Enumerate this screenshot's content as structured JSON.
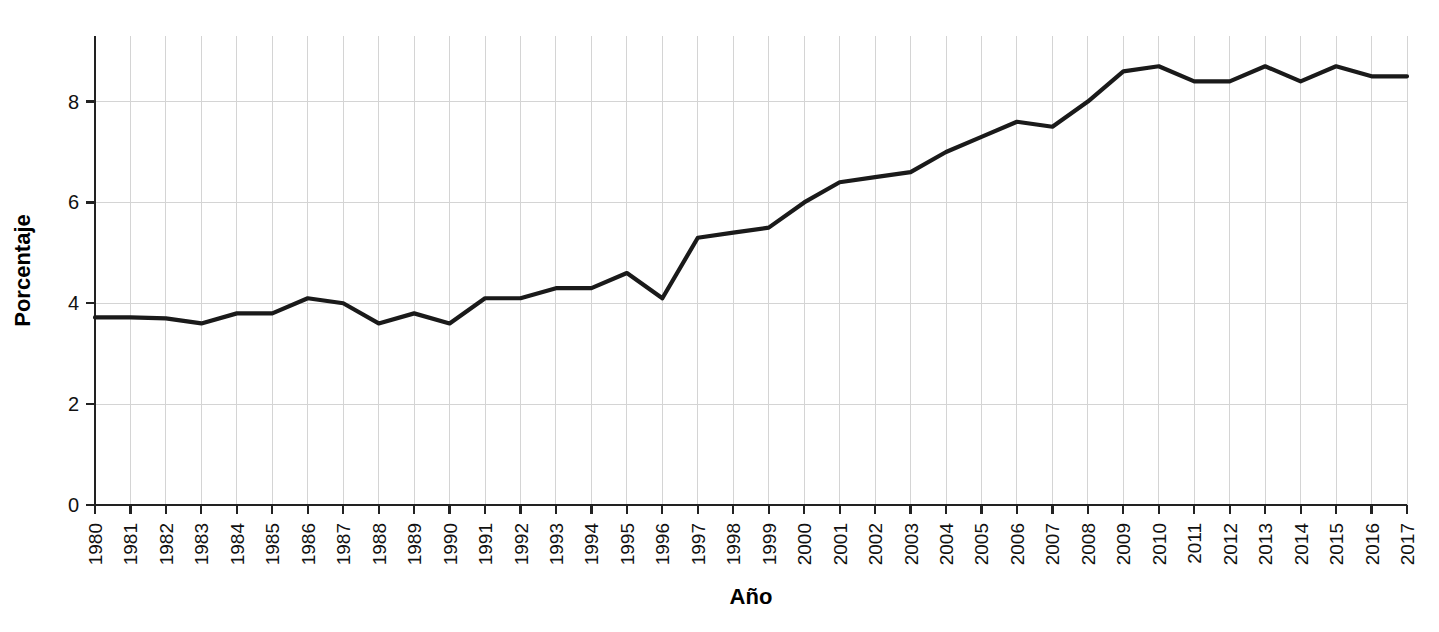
{
  "chart_data": {
    "type": "line",
    "title": "",
    "xlabel": "Año",
    "ylabel": "Porcentaje",
    "xlim": [
      1980,
      2017
    ],
    "ylim": [
      0,
      9.3
    ],
    "yticks": [
      0,
      2,
      4,
      6,
      8
    ],
    "ytick_labels": [
      "0",
      "2",
      "4",
      "6",
      "8"
    ],
    "grid": true,
    "legend": "none",
    "line_color": "#1a1a1a",
    "grid_color": "#d4d4d4",
    "axis_color": "#222222",
    "categories": [
      "1980",
      "1981",
      "1982",
      "1983",
      "1984",
      "1985",
      "1986",
      "1987",
      "1988",
      "1989",
      "1990",
      "1991",
      "1992",
      "1993",
      "1994",
      "1995",
      "1996",
      "1997",
      "1998",
      "1999",
      "2000",
      "2001",
      "2002",
      "2003",
      "2004",
      "2005",
      "2006",
      "2007",
      "2008",
      "2009",
      "2010",
      "2011",
      "2012",
      "2013",
      "2014",
      "2015",
      "2016",
      "2017"
    ],
    "x": [
      1980,
      1981,
      1982,
      1983,
      1984,
      1985,
      1986,
      1987,
      1988,
      1989,
      1990,
      1991,
      1992,
      1993,
      1994,
      1995,
      1996,
      1997,
      1998,
      1999,
      2000,
      2001,
      2002,
      2003,
      2004,
      2005,
      2006,
      2007,
      2008,
      2009,
      2010,
      2011,
      2012,
      2013,
      2014,
      2015,
      2016,
      2017
    ],
    "values": [
      3.72,
      3.72,
      3.7,
      3.6,
      3.8,
      3.8,
      4.1,
      4.0,
      3.6,
      3.8,
      3.6,
      4.1,
      4.1,
      4.3,
      4.3,
      4.6,
      4.1,
      5.3,
      5.4,
      5.5,
      6.0,
      6.4,
      6.5,
      6.6,
      7.0,
      7.3,
      7.6,
      7.5,
      8.0,
      8.6,
      8.7,
      8.4,
      8.4,
      8.7,
      8.4,
      8.7,
      8.5,
      8.5
    ],
    "series": [
      {
        "name": "Porcentaje",
        "values": [
          3.72,
          3.72,
          3.7,
          3.6,
          3.8,
          3.8,
          4.1,
          4.0,
          3.6,
          3.8,
          3.6,
          4.1,
          4.1,
          4.3,
          4.3,
          4.6,
          4.1,
          5.3,
          5.4,
          5.5,
          6.0,
          6.4,
          6.5,
          6.6,
          7.0,
          7.3,
          7.6,
          7.5,
          8.0,
          8.6,
          8.7,
          8.4,
          8.4,
          8.7,
          8.4,
          8.7,
          8.5,
          8.5
        ]
      }
    ]
  },
  "plot": {
    "left": 95,
    "right": 1407,
    "top": 36,
    "bottom": 505,
    "y_value_top": 9.3,
    "y_value_bottom": 0
  }
}
